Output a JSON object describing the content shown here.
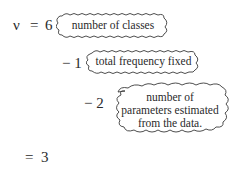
{
  "equation": {
    "lhs": "ν",
    "eq1": "=",
    "term1": "6",
    "term2": "− 1",
    "term3": "− 2",
    "result_eq": "=",
    "result": "3"
  },
  "annotations": {
    "classes": "number of classes",
    "total": "total frequency fixed",
    "params_line1": "number of",
    "params_line2": "parameters estimated",
    "params_line3": "from the data."
  },
  "colors": {
    "ink": "#2a2a2a",
    "background": "#ffffff"
  }
}
